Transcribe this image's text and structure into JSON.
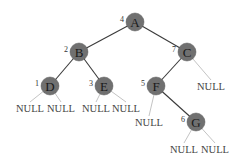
{
  "diagram": {
    "type": "binary-tree",
    "node_fill": "#707070",
    "edge_color": "#3a3a3a",
    "null_edge_color": "#9a9a9a",
    "nodes": [
      {
        "id": "A",
        "label": "A",
        "order": "4",
        "x": 135,
        "y": 22
      },
      {
        "id": "B",
        "label": "B",
        "order": "2",
        "x": 79,
        "y": 52
      },
      {
        "id": "C",
        "label": "C",
        "order": "7",
        "x": 187,
        "y": 52
      },
      {
        "id": "D",
        "label": "D",
        "order": "1",
        "x": 50,
        "y": 86
      },
      {
        "id": "E",
        "label": "E",
        "order": "3",
        "x": 104,
        "y": 86
      },
      {
        "id": "F",
        "label": "F",
        "order": "5",
        "x": 156,
        "y": 86
      },
      {
        "id": "G",
        "label": "G",
        "order": "6",
        "x": 196,
        "y": 122
      }
    ],
    "edges": [
      {
        "from": "A",
        "to": "B"
      },
      {
        "from": "A",
        "to": "C"
      },
      {
        "from": "B",
        "to": "D"
      },
      {
        "from": "B",
        "to": "E"
      },
      {
        "from": "C",
        "to": "F"
      },
      {
        "from": "F",
        "to": "G"
      }
    ],
    "null_leaves": [
      {
        "parent": "D",
        "side": "left",
        "label": "NULL",
        "x": 30,
        "y": 108
      },
      {
        "parent": "D",
        "side": "right",
        "label": "NULL",
        "x": 61,
        "y": 108
      },
      {
        "parent": "E",
        "side": "left",
        "label": "NULL",
        "x": 96,
        "y": 108
      },
      {
        "parent": "E",
        "side": "right",
        "label": "NULL",
        "x": 126,
        "y": 108
      },
      {
        "parent": "C",
        "side": "right",
        "label": "NULL",
        "x": 211,
        "y": 86
      },
      {
        "parent": "F",
        "side": "left",
        "label": "NULL",
        "x": 149,
        "y": 122
      },
      {
        "parent": "G",
        "side": "left",
        "label": "NULL",
        "x": 184,
        "y": 149
      },
      {
        "parent": "G",
        "side": "right",
        "label": "NULL",
        "x": 215,
        "y": 149
      }
    ]
  }
}
